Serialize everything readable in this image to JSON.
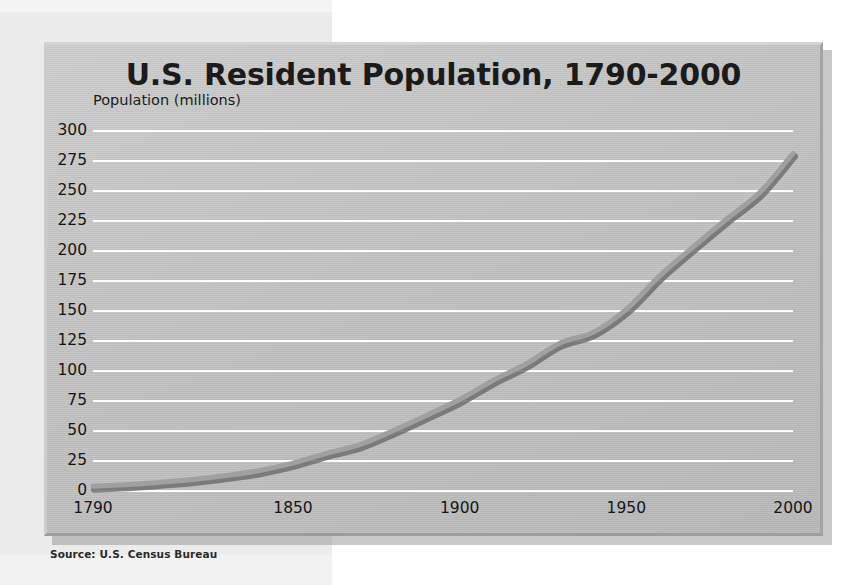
{
  "chart_data": {
    "type": "line",
    "title": "U.S. Resident Population, 1790-2000",
    "ylabel": "Population (millions)",
    "xlabel": "",
    "source": "Source: U.S. Census Bureau",
    "ylim": [
      0,
      300
    ],
    "xlim": [
      1790,
      2000
    ],
    "grid": true,
    "legend": null,
    "y_ticks": [
      "300",
      "275",
      "250",
      "225",
      "200",
      "175",
      "150",
      "125",
      "100",
      "75",
      "50",
      "25",
      "0"
    ],
    "y_tick_values": [
      300,
      275,
      250,
      225,
      200,
      175,
      150,
      125,
      100,
      75,
      50,
      25,
      0
    ],
    "x_ticks": [
      "1790",
      "1850",
      "1900",
      "1950",
      "2000"
    ],
    "x_tick_values": [
      1790,
      1850,
      1900,
      1950,
      2000
    ],
    "series": [
      {
        "name": "U.S. Resident Population",
        "color": "#8c8c8c",
        "x": [
          1790,
          1800,
          1810,
          1820,
          1830,
          1840,
          1850,
          1860,
          1870,
          1880,
          1890,
          1900,
          1910,
          1920,
          1930,
          1940,
          1950,
          1960,
          1970,
          1980,
          1990,
          2000
        ],
        "values": [
          3.9,
          5.3,
          7.2,
          9.6,
          12.9,
          17.1,
          23.2,
          31.4,
          38.6,
          50.2,
          63.0,
          76.2,
          92.2,
          106.0,
          123.2,
          132.2,
          151.3,
          179.3,
          203.3,
          226.5,
          248.7,
          281.4
        ]
      }
    ]
  },
  "panel": {
    "title": "U.S. Resident Population, 1790-2000",
    "y_caption": "Population (millions)",
    "source": "Source: U.S. Census Bureau"
  },
  "colors": {
    "panel_bg": "#c3c3c3",
    "gridline": "#fdfdfd",
    "line": "#8c8c8c",
    "line_shadow": "#6f6f6f",
    "text": "#161616",
    "page_left_bg": "#ececed",
    "page_right_bg": "#ffffff"
  }
}
